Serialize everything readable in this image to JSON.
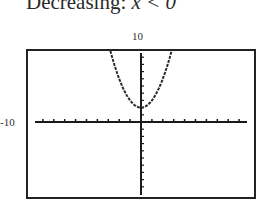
{
  "header": {
    "title_prefix": "Decreasing: ",
    "title_expr": "x < 0"
  },
  "chart_data": {
    "type": "line",
    "title": "Decreasing: x < 0",
    "xlabel": "",
    "ylabel": "",
    "xlim": [
      -10,
      10
    ],
    "ylim": [
      -10,
      10
    ],
    "tick_labels": {
      "ymax": "10",
      "xmin": "-10"
    },
    "x_tick_step": 1,
    "y_tick_step": 1,
    "grid": false,
    "series": [
      {
        "name": "parabola",
        "function": "y = x^2 + 2",
        "x": [
          -2.8,
          -2.5,
          -2,
          -1.5,
          -1,
          -0.5,
          0,
          0.5,
          1,
          1.5,
          2,
          2.5,
          2.8
        ],
        "y": [
          9.84,
          8.25,
          6,
          4.25,
          3,
          2.25,
          2,
          2.25,
          3,
          4.25,
          6,
          8.25,
          9.84
        ]
      }
    ],
    "colors": {
      "frame": "#222222",
      "curve": "#2a2a2a",
      "axes": "#1a1a1a"
    }
  }
}
